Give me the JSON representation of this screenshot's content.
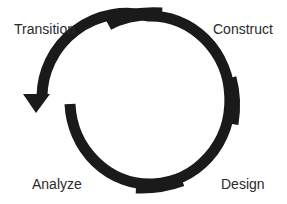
{
  "diagram": {
    "type": "cycle",
    "direction": "counter-clockwise",
    "stroke_color": "#1a1a1a",
    "background": "#ffffff",
    "phases": [
      {
        "label": "Analyze",
        "position": "bottom-left"
      },
      {
        "label": "Design",
        "position": "bottom-right"
      },
      {
        "label": "Construct",
        "position": "top-right"
      },
      {
        "label": "Transition",
        "position": "top-left"
      }
    ]
  },
  "labels": {
    "transition": "Transition",
    "construct": "Construct",
    "analyze": "Analyze",
    "design": "Design"
  }
}
